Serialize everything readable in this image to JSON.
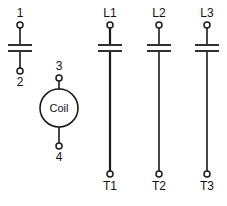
{
  "diagram": {
    "background_color": "#ffffff",
    "line_color": "#1a1a1a",
    "text_color": "#111111",
    "width": 227,
    "height": 206
  },
  "auxiliary_contact": {
    "name": "auxiliary-contact",
    "symbol": "contact-bar",
    "top_terminal_label": "1",
    "bottom_terminal_label": "2"
  },
  "coil": {
    "name": "coil",
    "symbol": "circle",
    "label": "Coil",
    "top_terminal_label": "3",
    "bottom_terminal_label": "4"
  },
  "power_poles": [
    {
      "name": "pole-1",
      "line_label": "L1",
      "load_label": "T1"
    },
    {
      "name": "pole-2",
      "line_label": "L2",
      "load_label": "T2"
    },
    {
      "name": "pole-3",
      "line_label": "L3",
      "load_label": "T3"
    }
  ]
}
